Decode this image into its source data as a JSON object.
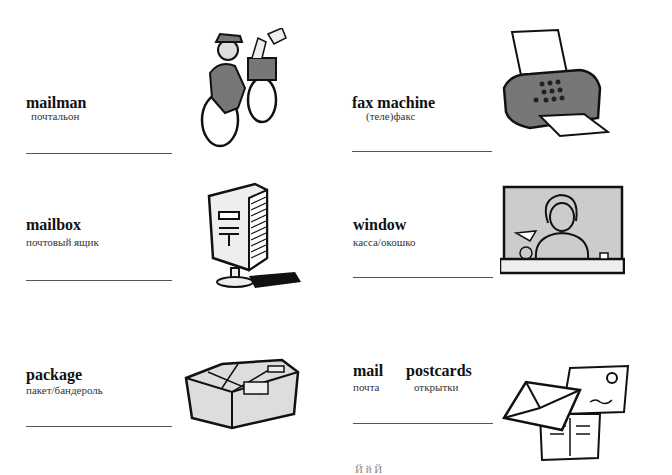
{
  "vocabulary": [
    {
      "english": "mailman",
      "russian": "почтальон",
      "icon": "mailman-on-bicycle-illustration"
    },
    {
      "english": "fax machine",
      "russian": "(теле)факс",
      "icon": "fax-machine-illustration"
    },
    {
      "english": "mailbox",
      "russian": "почтовый ящик",
      "icon": "mailbox-illustration"
    },
    {
      "english": "window",
      "russian": "касса/окошко",
      "icon": "post-office-window-illustration"
    },
    {
      "english": "package",
      "russian": "пакет/бандероль",
      "icon": "package-illustration"
    },
    {
      "english_a": "mail",
      "russian_a": "почта",
      "english_b": "postcards",
      "russian_b": "открытки",
      "icon": "mail-and-postcards-illustration"
    }
  ],
  "footer_fragment": "Й й         Й"
}
